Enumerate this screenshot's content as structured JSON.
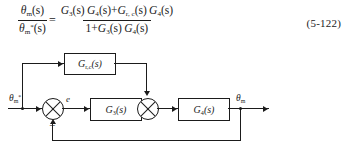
{
  "equation": {
    "lhs": {
      "numerator": {
        "symbol": "θ",
        "sub": "m",
        "arg": "(s)"
      },
      "denominator": {
        "symbol": "θ",
        "sub": "m",
        "sup": "*",
        "arg": "(s)"
      }
    },
    "equals": "=",
    "rhs": {
      "numerator_terms": [
        {
          "symbol": "G",
          "sub": "3",
          "arg": "(s)"
        },
        {
          "symbol": "G",
          "sub": "4",
          "arg": "(s)"
        },
        {
          "op": "+"
        },
        {
          "symbol": "G",
          "sub": "r, c",
          "arg": "(s)"
        },
        {
          "symbol": "G",
          "sub": "4",
          "arg": "(s)"
        }
      ],
      "denominator_terms": [
        {
          "text": "1"
        },
        {
          "op": "+"
        },
        {
          "symbol": "G",
          "sub": "3",
          "arg": "(s)"
        },
        {
          "symbol": "G",
          "sub": "4",
          "arg": "(s)"
        }
      ],
      "numerator_text": "G₃(s) G₄(s) + G_r,c(s) G₄(s)",
      "denominator_text": "1 + G₃(s) G₄(s)"
    },
    "number": "(5-122)"
  },
  "diagram": {
    "input_label": "θ*m",
    "input_symbol": "θ",
    "input_sub": "m",
    "input_sup": "*",
    "error_label": "e",
    "output_symbol": "θ",
    "output_sub": "m",
    "feedback_sign": "−",
    "blocks": [
      {
        "id": "feedforward",
        "label_symbol": "G",
        "label_sub": "r,c",
        "label_arg": "(s)",
        "label": "Gr,c(s)"
      },
      {
        "id": "controller",
        "label_symbol": "G",
        "label_sub": "3",
        "label_arg": "(s)",
        "label": "G3(s)"
      },
      {
        "id": "plant",
        "label_symbol": "G",
        "label_sub": "4",
        "label_arg": "(s)",
        "label": "G4(s)"
      }
    ],
    "summing_junctions": [
      {
        "id": "error-sum"
      },
      {
        "id": "feedforward-sum"
      }
    ]
  },
  "colors": {
    "ink": "#1b1b1b",
    "background": "#ffffff"
  }
}
